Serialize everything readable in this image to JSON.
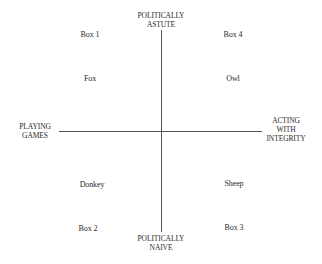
{
  "axes": {
    "top": [
      "POLITICALLY",
      "ASTUTE"
    ],
    "bottom": [
      "POLITICALLY",
      "NAIVE"
    ],
    "left": [
      "PLAYING",
      "GAMES"
    ],
    "right": [
      "ACTING",
      "WITH",
      "INTEGRITY"
    ]
  },
  "quadrants": [
    {
      "box": "Box 1",
      "animal": "Fox"
    },
    {
      "box": "Box 4",
      "animal": "Owl"
    },
    {
      "box": "Box 2",
      "animal": "Donkey"
    },
    {
      "box": "Box 3",
      "animal": "Sheep"
    }
  ]
}
